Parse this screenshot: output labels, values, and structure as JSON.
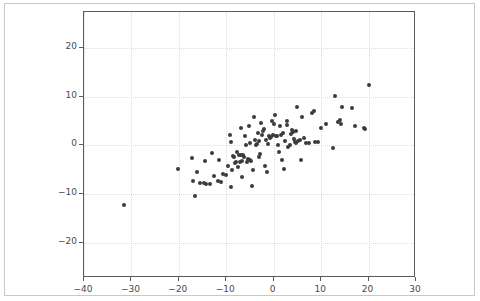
{
  "figure": {
    "title": "",
    "background_color": "#ffffff",
    "border_color": "#c8c8c8"
  },
  "chart_data": {
    "type": "scatter",
    "title": "",
    "xlabel": "",
    "ylabel": "",
    "xlim": [
      -40,
      30
    ],
    "ylim": [
      -27.3,
      27.5
    ],
    "xticks": [
      -40,
      -30,
      -20,
      -10,
      0,
      10,
      20,
      30
    ],
    "yticks": [
      -20,
      -10,
      0,
      10,
      20
    ],
    "xticklabels": [
      "−40",
      "−30",
      "−20",
      "−10",
      "0",
      "10",
      "20",
      "30"
    ],
    "yticklabels": [
      "−20",
      "−10",
      "0",
      "10",
      "20"
    ],
    "grid": true,
    "grid_color": "#dcdcdc",
    "grid_style": "dotted",
    "legend": null,
    "marker": "o",
    "marker_color": "#3b3b3b",
    "marker_size": 4,
    "n_points": 110,
    "points": [
      [
        -31.5,
        -12.2
      ],
      [
        -20.1,
        -4.8
      ],
      [
        -17.2,
        -2.6
      ],
      [
        -17.0,
        -7.4
      ],
      [
        -16.7,
        -10.4
      ],
      [
        -16.1,
        -5.5
      ],
      [
        -15.5,
        -7.7
      ],
      [
        -14.6,
        -7.7
      ],
      [
        -14.4,
        -3.2
      ],
      [
        -14.2,
        -7.9
      ],
      [
        -13.4,
        -8.0
      ],
      [
        -13.1,
        -1.5
      ],
      [
        -12.6,
        -6.2
      ],
      [
        -11.8,
        -7.4
      ],
      [
        -11.6,
        -3.0
      ],
      [
        -11.2,
        -7.6
      ],
      [
        -10.6,
        -5.8
      ],
      [
        -10.1,
        -6.1
      ],
      [
        -9.6,
        -4.3
      ],
      [
        -9.3,
        2.1
      ],
      [
        -9.1,
        -8.6
      ],
      [
        -9.0,
        0.7
      ],
      [
        -8.8,
        -5.1
      ],
      [
        -8.6,
        -2.1
      ],
      [
        -8.3,
        -2.3
      ],
      [
        -8.1,
        -3.6
      ],
      [
        -7.9,
        -3.5
      ],
      [
        -7.7,
        -1.4
      ],
      [
        -7.6,
        -4.4
      ],
      [
        -7.4,
        -2.0
      ],
      [
        -7.2,
        -3.4
      ],
      [
        -7.0,
        -2.0
      ],
      [
        -6.9,
        3.6
      ],
      [
        -6.7,
        -6.4
      ],
      [
        -6.6,
        -3.1
      ],
      [
        -6.4,
        -1.9
      ],
      [
        -6.2,
        -2.4
      ],
      [
        -6.0,
        1.9
      ],
      [
        -5.8,
        0.2
      ],
      [
        -5.6,
        -3.4
      ],
      [
        -5.4,
        -2.7
      ],
      [
        -5.2,
        4.1
      ],
      [
        -5.0,
        0.5
      ],
      [
        -4.9,
        -3.0
      ],
      [
        -4.7,
        -3.2
      ],
      [
        -4.5,
        -8.4
      ],
      [
        -4.3,
        -5.0
      ],
      [
        -4.2,
        5.9
      ],
      [
        -4.0,
        1.2
      ],
      [
        -3.8,
        0.0
      ],
      [
        -3.6,
        0.3
      ],
      [
        -3.4,
        2.6
      ],
      [
        -3.2,
        -2.4
      ],
      [
        -3.0,
        1.0
      ],
      [
        -2.8,
        -1.7
      ],
      [
        -2.6,
        4.6
      ],
      [
        -2.4,
        2.1
      ],
      [
        -2.2,
        3.0
      ],
      [
        -2.0,
        3.3
      ],
      [
        -1.8,
        -4.2
      ],
      [
        -1.6,
        1.1
      ],
      [
        -1.4,
        -5.5
      ],
      [
        -1.2,
        0.4
      ],
      [
        -1.0,
        2.0
      ],
      [
        -0.8,
        1.6
      ],
      [
        -0.5,
        1.8
      ],
      [
        -0.3,
        5.1
      ],
      [
        -0.1,
        2.2
      ],
      [
        0.1,
        4.4
      ],
      [
        0.3,
        6.2
      ],
      [
        0.5,
        2.0
      ],
      [
        0.7,
        1.9
      ],
      [
        0.9,
        0.1
      ],
      [
        1.1,
        -1.3
      ],
      [
        1.3,
        4.0
      ],
      [
        1.6,
        2.2
      ],
      [
        1.8,
        -2.9
      ],
      [
        2.0,
        2.5
      ],
      [
        2.2,
        -4.8
      ],
      [
        2.4,
        1.0
      ],
      [
        2.7,
        4.2
      ],
      [
        2.9,
        5.1
      ],
      [
        3.1,
        -0.3
      ],
      [
        3.4,
        0.2
      ],
      [
        3.6,
        2.3
      ],
      [
        3.8,
        3.1
      ],
      [
        4.0,
        2.7
      ],
      [
        4.2,
        1.3
      ],
      [
        4.4,
        0.7
      ],
      [
        4.6,
        3.0
      ],
      [
        4.8,
        0.5
      ],
      [
        5.0,
        7.9
      ],
      [
        5.2,
        0.9
      ],
      [
        5.5,
        1.1
      ],
      [
        5.8,
        -3.0
      ],
      [
        6.0,
        5.9
      ],
      [
        6.3,
        1.6
      ],
      [
        6.8,
        0.6
      ],
      [
        7.4,
        0.6
      ],
      [
        8.0,
        6.7
      ],
      [
        8.4,
        7.1
      ],
      [
        8.8,
        0.8
      ],
      [
        9.3,
        0.8
      ],
      [
        9.9,
        3.6
      ],
      [
        11.0,
        4.5
      ],
      [
        12.6,
        -0.5
      ],
      [
        13.0,
        10.1
      ],
      [
        13.6,
        4.9
      ],
      [
        14.0,
        5.3
      ],
      [
        14.1,
        4.4
      ],
      [
        14.3,
        8.0
      ],
      [
        16.5,
        7.7
      ],
      [
        17.2,
        4.0
      ],
      [
        19.0,
        3.7
      ],
      [
        19.3,
        3.4
      ],
      [
        20.0,
        12.5
      ]
    ]
  }
}
